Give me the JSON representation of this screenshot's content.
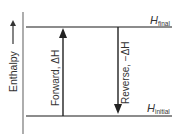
{
  "diagram": {
    "type": "enthalpy-level-diagram",
    "axis": {
      "label": "Enthalpy",
      "direction_icon": "up-arrow-icon"
    },
    "levels": [
      {
        "id": "final",
        "symbol": "H",
        "subscript": "final",
        "position": "top"
      },
      {
        "id": "initial",
        "symbol": "H",
        "subscript": "initial",
        "position": "bottom"
      }
    ],
    "arrows": [
      {
        "id": "forward",
        "label": "Forward, ΔH",
        "direction": "up",
        "from": "initial",
        "to": "final"
      },
      {
        "id": "reverse",
        "label": "Reverse, −ΔH",
        "direction": "down",
        "from": "final",
        "to": "initial"
      }
    ],
    "colors": {
      "lines": "#555555",
      "arrows": "#222222",
      "text": "#333333",
      "background": "#ffffff"
    }
  }
}
